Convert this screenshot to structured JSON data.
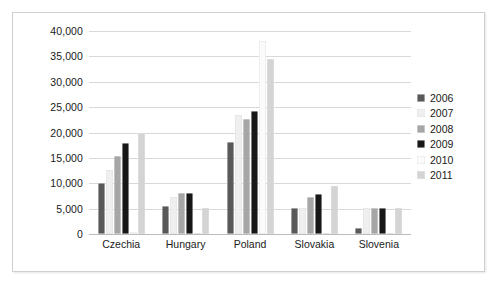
{
  "chart_data": {
    "type": "bar",
    "title": "",
    "subtitle": "",
    "xlabel": "",
    "ylabel": "",
    "categories": [
      "Czechia",
      "Hungary",
      "Poland",
      "Slovakia",
      "Slovenia"
    ],
    "series": [
      {
        "name": "2006",
        "color": "#595959",
        "values": [
          10100,
          5600,
          18200,
          5100,
          1200
        ]
      },
      {
        "name": "2007",
        "color": "#efefef",
        "values": [
          12600,
          7300,
          23400,
          5100,
          5100
        ]
      },
      {
        "name": "2008",
        "color": "#a6a6a6",
        "values": [
          15300,
          8000,
          22600,
          7200,
          5200
        ]
      },
      {
        "name": "2009",
        "color": "#171717",
        "values": [
          18000,
          8100,
          24200,
          7900,
          5100
        ]
      },
      {
        "name": "2010",
        "color": "#fbfbfb",
        "values": [
          300,
          200,
          38000,
          200,
          200
        ]
      },
      {
        "name": "2011",
        "color": "#d4d4d4",
        "values": [
          20000,
          5100,
          34500,
          9500,
          5200
        ]
      }
    ],
    "ylim": [
      0,
      40000
    ],
    "yticks": [
      0,
      5000,
      10000,
      15000,
      20000,
      25000,
      30000,
      35000,
      40000
    ],
    "ytick_labels": [
      "0",
      "5,000",
      "10,000",
      "15,000",
      "20,000",
      "25,000",
      "30,000",
      "35,000",
      "40,000"
    ],
    "grid": true,
    "legend_position": "right",
    "legend_entries": [
      "2006",
      "2007",
      "2008",
      "2009",
      "2010",
      "2011"
    ],
    "axis_line_color": "#bcbcbc",
    "gridline_color": "#d9d9d9",
    "background_color": "#ffffff",
    "border_color": "#cfcfcf"
  }
}
